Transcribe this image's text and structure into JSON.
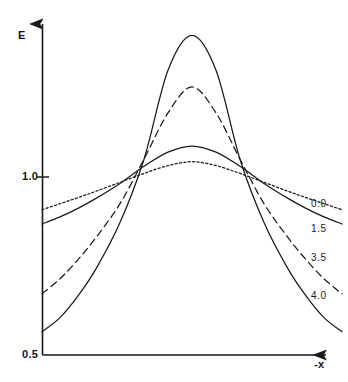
{
  "chart_data": {
    "type": "line",
    "title": "",
    "subtitle": "",
    "xlabel": "-x",
    "ylabel": "E",
    "ylim": [
      0.5,
      1.9
    ],
    "xlim": [
      0,
      1
    ],
    "grid": false,
    "legend_position": "right-inline",
    "y_ticks": [
      {
        "value": 0.5,
        "label": "0.5"
      },
      {
        "value": 1.0,
        "label": "1.0"
      }
    ],
    "x_ticks": [],
    "annotations": [
      "All four curves intersect at two common nodes where E = 1.0",
      "Curves are symmetric bell shapes peaking at mid-range of -x"
    ],
    "series": [
      {
        "name": "0.0",
        "label": "0.0",
        "style": "dotted",
        "color": "#1a1a1a",
        "x": [
          0.0,
          0.06,
          0.12,
          0.18,
          0.26,
          0.34,
          0.42,
          0.5,
          0.58,
          0.66,
          0.74,
          0.82,
          0.88,
          0.94,
          1.0
        ],
        "y": [
          0.908,
          0.925,
          0.942,
          0.96,
          0.985,
          1.01,
          1.032,
          1.043,
          1.032,
          1.01,
          0.985,
          0.96,
          0.942,
          0.925,
          0.908
        ],
        "peak": {
          "x": 0.5,
          "y": 1.043
        },
        "endpoints": {
          "left": 0.908,
          "right": 0.908
        }
      },
      {
        "name": "1.5",
        "label": "1.5",
        "style": "solid",
        "color": "#1a1a1a",
        "x": [
          0.0,
          0.06,
          0.12,
          0.18,
          0.26,
          0.34,
          0.42,
          0.5,
          0.58,
          0.66,
          0.74,
          0.82,
          0.88,
          0.94,
          1.0
        ],
        "y": [
          0.868,
          0.888,
          0.912,
          0.94,
          0.982,
          1.03,
          1.07,
          1.087,
          1.07,
          1.03,
          0.982,
          0.94,
          0.912,
          0.888,
          0.868
        ],
        "peak": {
          "x": 0.5,
          "y": 1.087
        },
        "endpoints": {
          "left": 0.868,
          "right": 0.868
        }
      },
      {
        "name": "3.5",
        "label": "3.5",
        "style": "dashed",
        "color": "#1a1a1a",
        "x": [
          0.0,
          0.06,
          0.12,
          0.18,
          0.26,
          0.34,
          0.42,
          0.5,
          0.58,
          0.66,
          0.74,
          0.82,
          0.88,
          0.94,
          1.0
        ],
        "y": [
          0.672,
          0.714,
          0.768,
          0.83,
          0.925,
          1.05,
          1.18,
          1.253,
          1.18,
          1.05,
          0.925,
          0.83,
          0.768,
          0.714,
          0.672
        ],
        "peak": {
          "x": 0.5,
          "y": 1.253
        },
        "endpoints": {
          "left": 0.672,
          "right": 0.672
        }
      },
      {
        "name": "4.0",
        "label": "4.0",
        "style": "solid",
        "color": "#1a1a1a",
        "x": [
          0.0,
          0.06,
          0.12,
          0.18,
          0.26,
          0.34,
          0.42,
          0.5,
          0.58,
          0.66,
          0.74,
          0.82,
          0.88,
          0.94,
          1.0
        ],
        "y": [
          0.565,
          0.605,
          0.666,
          0.742,
          0.872,
          1.05,
          1.3,
          1.398,
          1.3,
          1.05,
          0.872,
          0.742,
          0.666,
          0.605,
          0.565
        ],
        "peak": {
          "x": 0.5,
          "y": 1.398
        },
        "endpoints": {
          "left": 0.565,
          "right": 0.565
        }
      }
    ]
  },
  "axes": {
    "y_label": "E",
    "x_label": "-x",
    "y_tick_top_label": "1.0",
    "y_tick_bottom_label": "0.5"
  },
  "curve_labels": {
    "c0": "0.0",
    "c1": "1.5",
    "c2": "3.5",
    "c3": "4.0"
  }
}
